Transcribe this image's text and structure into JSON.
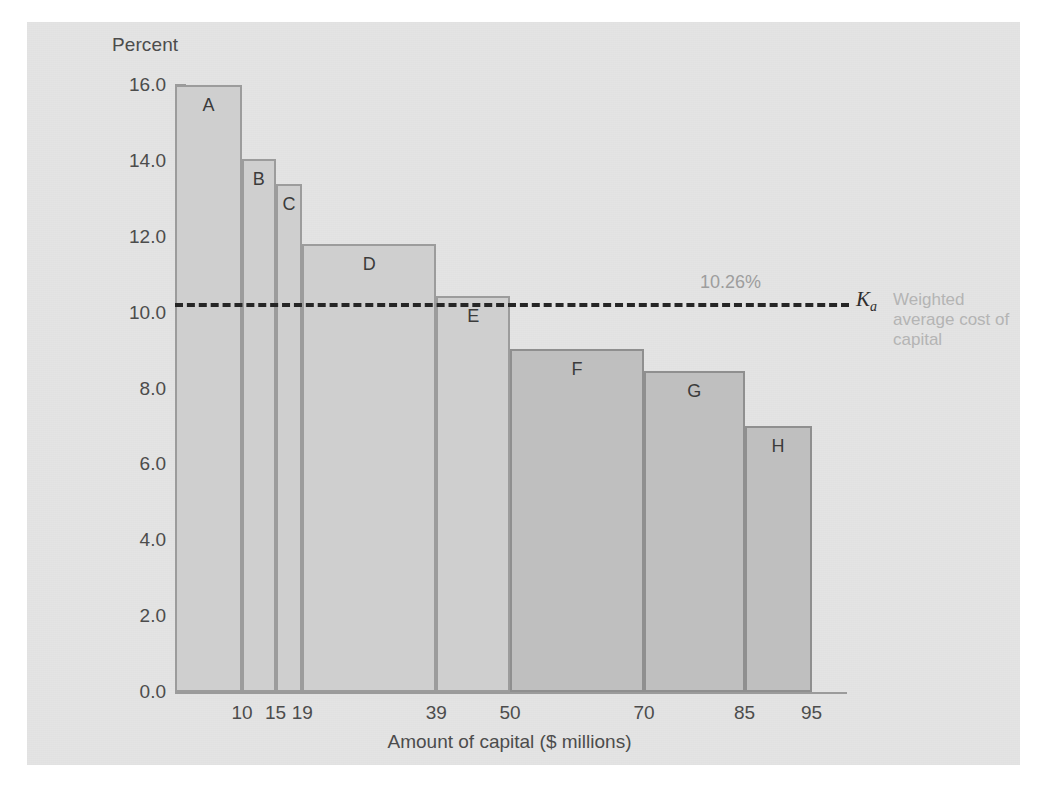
{
  "chart_data": {
    "type": "bar",
    "title": "",
    "ylabel": "Percent",
    "xlabel": "Amount of capital ($ millions)",
    "ylim": [
      0.0,
      16.0
    ],
    "xlim": [
      0,
      100
    ],
    "grid": false,
    "legend": "none",
    "y_ticks": [
      "0.0",
      "2.0",
      "4.0",
      "6.0",
      "8.0",
      "10.0",
      "12.0",
      "14.0",
      "16.0"
    ],
    "y_tick_values": [
      0.0,
      2.0,
      4.0,
      6.0,
      8.0,
      10.0,
      12.0,
      14.0,
      16.0
    ],
    "y_minor_tick_values": [
      1.0,
      3.0,
      5.0,
      7.0,
      9.0,
      11.0,
      13.0,
      15.0
    ],
    "x_ticks": [
      "10",
      "15",
      "19",
      "39",
      "50",
      "70",
      "85",
      "95"
    ],
    "x_tick_values": [
      10,
      15,
      19,
      39,
      50,
      70,
      85,
      95
    ],
    "categories": [
      "A",
      "B",
      "C",
      "D",
      "E",
      "F",
      "G",
      "H"
    ],
    "values": [
      16.0,
      14.05,
      13.4,
      11.8,
      10.45,
      9.05,
      8.45,
      7.0
    ],
    "bars": [
      {
        "label": "A",
        "value": 16.0,
        "x_start": 0,
        "x_end": 10,
        "shade": "light"
      },
      {
        "label": "B",
        "value": 14.05,
        "x_start": 10,
        "x_end": 15,
        "shade": "light"
      },
      {
        "label": "C",
        "value": 13.4,
        "x_start": 15,
        "x_end": 19,
        "shade": "light"
      },
      {
        "label": "D",
        "value": 11.8,
        "x_start": 19,
        "x_end": 39,
        "shade": "light"
      },
      {
        "label": "E",
        "value": 10.45,
        "x_start": 39,
        "x_end": 50,
        "shade": "light"
      },
      {
        "label": "F",
        "value": 9.05,
        "x_start": 50,
        "x_end": 70,
        "shade": "dark"
      },
      {
        "label": "G",
        "value": 8.45,
        "x_start": 70,
        "x_end": 85,
        "shade": "dark"
      },
      {
        "label": "H",
        "value": 7.0,
        "x_start": 85,
        "x_end": 95,
        "shade": "dark"
      }
    ],
    "annotations": {
      "wacc_line_value": 10.26,
      "wacc_value_label": "10.26%",
      "wacc_symbol": "K",
      "wacc_symbol_sub": "a",
      "wacc_note": "Weighted average cost of capital"
    }
  },
  "colors": {
    "panel_background": "#e4e4e4",
    "bar_light": "#cfcfcf",
    "bar_dark": "#bfbfbf",
    "bar_outline": "#9c9c9c",
    "axis": "#9b9b9b",
    "text": "#4c4c4c",
    "wacc_line": "#262626",
    "wacc_value_text": "#9d9d9d",
    "wacc_note_text": "#b4b4b4"
  }
}
